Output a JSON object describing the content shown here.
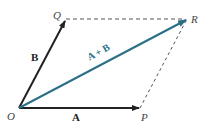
{
  "diagram": {
    "points": {
      "O": {
        "label": "O",
        "x": 19,
        "y": 108
      },
      "P": {
        "label": "P",
        "x": 140,
        "y": 108
      },
      "Q": {
        "label": "Q",
        "x": 66,
        "y": 19
      },
      "R": {
        "label": "R",
        "x": 187,
        "y": 19
      }
    },
    "vectors": {
      "A": {
        "label": "A",
        "from": "O",
        "to": "P",
        "color": "#222222"
      },
      "B": {
        "label": "B",
        "from": "O",
        "to": "Q",
        "color": "#222222"
      },
      "sum": {
        "label": "A + B",
        "from": "O",
        "to": "R",
        "color": "#2a6f86"
      }
    },
    "dashed_edges": [
      {
        "from": "Q",
        "to": "R",
        "color": "#555555"
      },
      {
        "from": "P",
        "to": "R",
        "color": "#555555"
      }
    ]
  }
}
